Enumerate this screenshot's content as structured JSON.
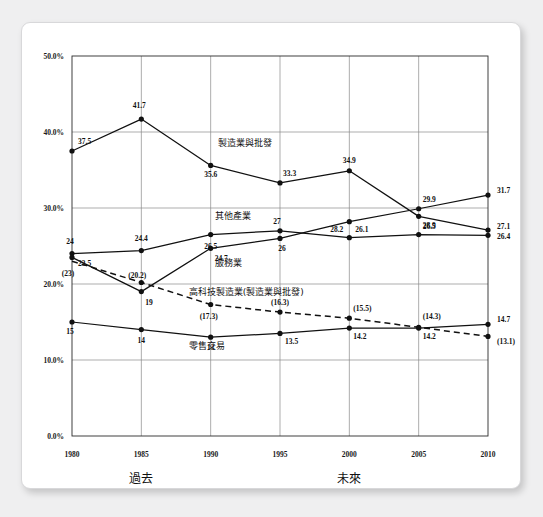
{
  "chart_data": {
    "type": "line",
    "title": "",
    "xlabel": "",
    "ylabel": "",
    "categories": [
      "1980",
      "1985",
      "1990",
      "1995",
      "2000",
      "2005",
      "2010"
    ],
    "x": [
      1980,
      1985,
      1990,
      1995,
      2000,
      2005,
      2010
    ],
    "ylim": [
      0,
      50
    ],
    "ytick_labels": [
      "0.0%",
      "10.0%",
      "20.0%",
      "30.0%",
      "40.0%",
      "50.0%"
    ],
    "ytick_values": [
      0,
      10,
      20,
      30,
      40,
      50
    ],
    "grid": true,
    "legend": "inline-annotations",
    "series": [
      {
        "name": "製造業與批發",
        "style": "solid",
        "values": [
          37.5,
          41.7,
          35.6,
          33.3,
          34.9,
          28.9,
          27.1
        ],
        "value_labels": [
          "37.5",
          "41.7",
          "35.6",
          "33.3",
          "34.9",
          "28.9",
          "27.1"
        ]
      },
      {
        "name": "其他產業",
        "style": "solid",
        "values": [
          24,
          24.4,
          26.5,
          27,
          26.1,
          26.5,
          26.4
        ],
        "value_labels": [
          "24",
          "24.4",
          "26.5",
          "27",
          "26.1",
          "26.5",
          "26.4"
        ]
      },
      {
        "name": "服務業",
        "style": "solid",
        "values": [
          23.5,
          19,
          24.7,
          26,
          28.2,
          29.9,
          31.7
        ],
        "value_labels": [
          "23.5",
          "19",
          "24.7",
          "26",
          "28.2",
          "29.9",
          "31.7"
        ]
      },
      {
        "name": "高科技製造業(製造業與批發)",
        "style": "dashed",
        "values": [
          23,
          20.2,
          17.3,
          16.3,
          15.5,
          14.3,
          13.1
        ],
        "value_labels": [
          "(23)",
          "(20.2)",
          "(17.3)",
          "(16.3)",
          "(15.5)",
          "(14.3)",
          "(13.1)"
        ]
      },
      {
        "name": "零售交易",
        "style": "solid",
        "values": [
          15,
          14,
          13,
          13.5,
          14.2,
          14.2,
          14.7
        ],
        "value_labels": [
          "15",
          "14",
          "13",
          "13.5",
          "14.2",
          "14.2",
          "14.7"
        ]
      }
    ],
    "annotations": [
      {
        "text": "製造業與批發",
        "near": "1995-upper"
      },
      {
        "text": "其他產業",
        "near": "1990-mid"
      },
      {
        "text": "服務業",
        "near": "1990-lower"
      },
      {
        "text": "高科技製造業(製造業與批發)",
        "near": "1990-dashed"
      },
      {
        "text": "零售交易",
        "near": "1990-bottom"
      }
    ],
    "period_labels": [
      {
        "text": "過去"
      },
      {
        "text": "未來"
      }
    ]
  }
}
